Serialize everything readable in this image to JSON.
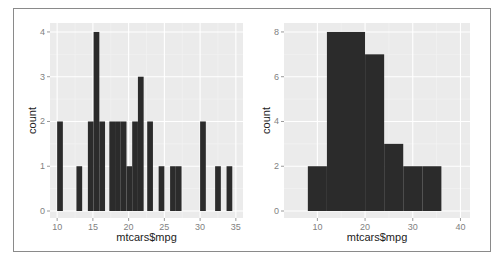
{
  "chart_data": [
    {
      "type": "bar",
      "subtype": "histogram",
      "title": "",
      "xlabel": "mtcars$mpg",
      "ylabel": "count",
      "xlim": [
        9.0,
        36.0
      ],
      "ylim": [
        0,
        4.2
      ],
      "x_ticks": [
        10,
        15,
        20,
        25,
        30,
        35
      ],
      "y_ticks": [
        0,
        1,
        2,
        3,
        4
      ],
      "grid": true,
      "legend": "none",
      "bins": [
        {
          "x0": 10.0,
          "x1": 10.8,
          "count": 2
        },
        {
          "x0": 12.7,
          "x1": 13.5,
          "count": 1
        },
        {
          "x0": 14.3,
          "x1": 15.1,
          "count": 2
        },
        {
          "x0": 15.1,
          "x1": 15.9,
          "count": 4
        },
        {
          "x0": 15.9,
          "x1": 16.7,
          "count": 2
        },
        {
          "x0": 17.3,
          "x1": 18.1,
          "count": 2
        },
        {
          "x0": 18.1,
          "x1": 18.9,
          "count": 2
        },
        {
          "x0": 18.9,
          "x1": 19.7,
          "count": 2
        },
        {
          "x0": 19.7,
          "x1": 20.5,
          "count": 1
        },
        {
          "x0": 20.5,
          "x1": 21.3,
          "count": 2
        },
        {
          "x0": 21.3,
          "x1": 22.1,
          "count": 3
        },
        {
          "x0": 22.6,
          "x1": 23.4,
          "count": 2
        },
        {
          "x0": 24.2,
          "x1": 25.0,
          "count": 1
        },
        {
          "x0": 25.8,
          "x1": 26.6,
          "count": 1
        },
        {
          "x0": 26.6,
          "x1": 27.4,
          "count": 1
        },
        {
          "x0": 30.0,
          "x1": 30.8,
          "count": 2
        },
        {
          "x0": 32.1,
          "x1": 32.9,
          "count": 1
        },
        {
          "x0": 33.7,
          "x1": 34.5,
          "count": 1
        }
      ]
    },
    {
      "type": "bar",
      "subtype": "histogram",
      "title": "",
      "xlabel": "mtcars$mpg",
      "ylabel": "count",
      "xlim": [
        3.0,
        42.0
      ],
      "ylim": [
        0,
        8.4
      ],
      "x_ticks": [
        10,
        20,
        30,
        40
      ],
      "y_ticks": [
        0,
        2,
        4,
        6,
        8
      ],
      "grid": true,
      "legend": "none",
      "binwidth": 4,
      "bins": [
        {
          "x0": 8,
          "x1": 12,
          "count": 2
        },
        {
          "x0": 12,
          "x1": 16,
          "count": 8
        },
        {
          "x0": 16,
          "x1": 20,
          "count": 8
        },
        {
          "x0": 20,
          "x1": 24,
          "count": 7
        },
        {
          "x0": 24,
          "x1": 28,
          "count": 3
        },
        {
          "x0": 28,
          "x1": 32,
          "count": 2
        },
        {
          "x0": 32,
          "x1": 36,
          "count": 2
        }
      ]
    }
  ],
  "style": {
    "panel_bg": "#ebebeb",
    "grid_major": "#ffffff",
    "grid_minor": "#f4f4f4",
    "bar_fill": "#2b2b2b",
    "tick_color": "#7f7f7f"
  }
}
